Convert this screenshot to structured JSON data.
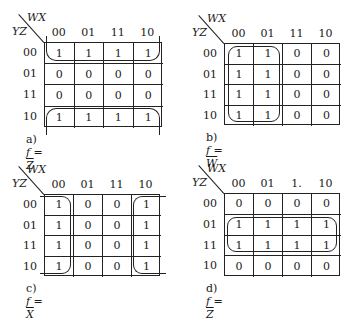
{
  "col_var": "WX",
  "row_var": "YZ",
  "col_labels": [
    "00",
    "01",
    "11",
    "10"
  ],
  "row_labels": [
    "00",
    "01",
    "11",
    "10"
  ],
  "maps": [
    {
      "id": "a",
      "caption_label": "a)",
      "caption_lhs": "f =",
      "caption_rhs": "Z",
      "values": [
        [
          "1",
          "1",
          "1",
          "1"
        ],
        [
          "0",
          "0",
          "0",
          "0"
        ],
        [
          "0",
          "0",
          "0",
          "0"
        ],
        [
          "1",
          "1",
          "1",
          "1"
        ]
      ]
    },
    {
      "id": "b",
      "caption_label": "b)",
      "caption_lhs": "f =",
      "caption_rhs": "W",
      "values": [
        [
          "1",
          "1",
          "0",
          "0"
        ],
        [
          "1",
          "1",
          "0",
          "0"
        ],
        [
          "1",
          "1",
          "0",
          "0"
        ],
        [
          "1",
          "1",
          "0",
          "0"
        ]
      ]
    },
    {
      "id": "c",
      "caption_label": "c)",
      "caption_lhs": "f =",
      "caption_rhs": "X",
      "values": [
        [
          "1",
          "0",
          "0",
          "1"
        ],
        [
          "1",
          "0",
          "0",
          "1"
        ],
        [
          "1",
          "0",
          "0",
          "1"
        ],
        [
          "1",
          "0",
          "0",
          "1"
        ]
      ]
    },
    {
      "id": "d",
      "caption_label": "d)",
      "caption_lhs": "f =",
      "caption_rhs": "Z",
      "col_labels_override": [
        "00",
        "01",
        "1.",
        "10"
      ],
      "values": [
        [
          "0",
          "0",
          "0",
          "0"
        ],
        [
          "1",
          "1",
          "1",
          "1"
        ],
        [
          "1",
          "1",
          "1",
          "1"
        ],
        [
          "0",
          "0",
          "0",
          "0"
        ]
      ]
    }
  ]
}
